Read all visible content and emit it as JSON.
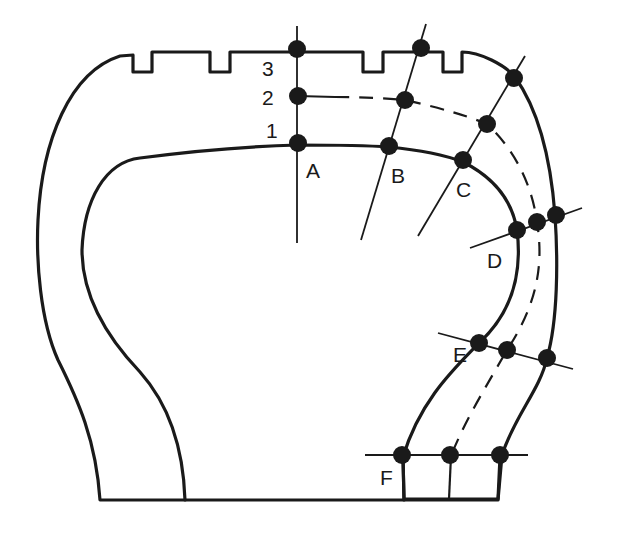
{
  "figure": {
    "layer_labels": [
      "1",
      "2",
      "3"
    ],
    "station_labels": [
      "A",
      "B",
      "C",
      "D",
      "E",
      "F"
    ],
    "colors": {
      "ink": "#1a1a1a",
      "background": "#ffffff"
    }
  },
  "labels": {
    "layer1": "1",
    "layer2": "2",
    "layer3": "3",
    "stationA": "A",
    "stationB": "B",
    "stationC": "C",
    "stationD": "D",
    "stationE": "E",
    "stationF": "F"
  }
}
